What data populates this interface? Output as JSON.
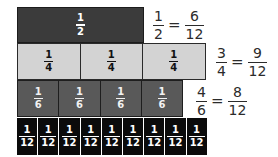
{
  "diagram": {
    "colors": {
      "half": "#3b3b3b",
      "quarter": "#d3d3d3",
      "sixth": "#595959",
      "twelfth": "#0b0b0b",
      "equation_text": "#2b2b2b"
    },
    "rows": [
      {
        "name": "halves",
        "pieces": [
          {
            "num": "1",
            "den": "2"
          }
        ],
        "equation": {
          "left_num": "1",
          "left_den": "2",
          "equals": "=",
          "right_num": "6",
          "right_den": "12"
        }
      },
      {
        "name": "quarters",
        "pieces": [
          {
            "num": "1",
            "den": "4"
          },
          {
            "num": "1",
            "den": "4"
          },
          {
            "num": "1",
            "den": "4"
          }
        ],
        "equation": {
          "left_num": "3",
          "left_den": "4",
          "equals": "=",
          "right_num": "9",
          "right_den": "12"
        }
      },
      {
        "name": "sixths",
        "pieces": [
          {
            "num": "1",
            "den": "6"
          },
          {
            "num": "1",
            "den": "6"
          },
          {
            "num": "1",
            "den": "6"
          },
          {
            "num": "1",
            "den": "6"
          }
        ],
        "equation": {
          "left_num": "4",
          "left_den": "6",
          "equals": "=",
          "right_num": "8",
          "right_den": "12"
        }
      },
      {
        "name": "twelfths",
        "pieces": [
          {
            "num": "1",
            "den": "12"
          },
          {
            "num": "1",
            "den": "12"
          },
          {
            "num": "1",
            "den": "12"
          },
          {
            "num": "1",
            "den": "12"
          },
          {
            "num": "1",
            "den": "12"
          },
          {
            "num": "1",
            "den": "12"
          },
          {
            "num": "1",
            "den": "12"
          },
          {
            "num": "1",
            "den": "12"
          },
          {
            "num": "1",
            "den": "12"
          }
        ]
      }
    ]
  }
}
